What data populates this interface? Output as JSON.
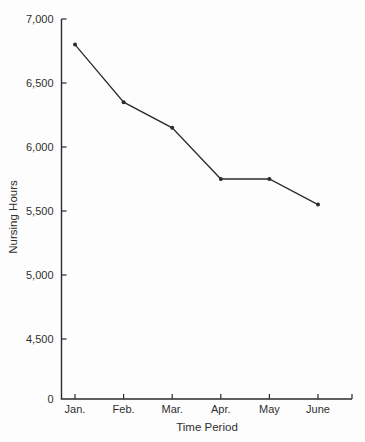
{
  "chart_data": {
    "type": "line",
    "title": "",
    "xlabel": "Time Period",
    "ylabel": "Nursing Hours",
    "categories": [
      "Jan.",
      "Feb.",
      "Mar.",
      "Apr.",
      "May",
      "June"
    ],
    "values": [
      6800,
      6350,
      6150,
      5750,
      5750,
      5550
    ],
    "series_name": "Nursing Hours",
    "y_ticks": [
      {
        "value": 7000,
        "label": "7,000"
      },
      {
        "value": 6500,
        "label": "6,500"
      },
      {
        "value": 6000,
        "label": "6,000"
      },
      {
        "value": 5500,
        "label": "5,500"
      },
      {
        "value": 5000,
        "label": "5,000"
      },
      {
        "value": 4500,
        "label": "4,500"
      },
      {
        "value": 0,
        "label": "0"
      }
    ],
    "ylim": [
      0,
      7000
    ],
    "axis_break_between": [
      0,
      4500
    ],
    "grid": false,
    "legend": "none",
    "unlabeled_end_tick_x_axis": true,
    "line_color": "#2b2b2b",
    "marker": "filled-dot",
    "axis_color": "#2b2b2b"
  }
}
